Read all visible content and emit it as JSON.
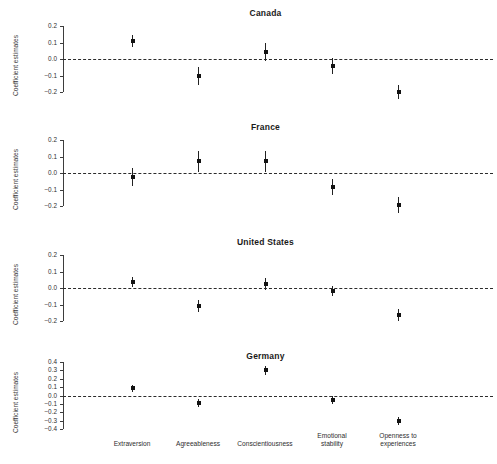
{
  "figure": {
    "ylabel": "Coefficient estimates",
    "categories": [
      "Extraversion",
      "Agreeableness",
      "Conscientiousness",
      "Emotional\nstability",
      "Openness to\nexperiences"
    ]
  },
  "chart_data": {
    "type": "scatter",
    "title": "",
    "xlabel": "",
    "ylabel": "Coefficient estimates",
    "grid": false,
    "legend": "none",
    "style": "coefficient plot with 95% confidence intervals, dashed zero reference line",
    "categories": [
      "Extraversion",
      "Agreeableness",
      "Conscientiousness",
      "Emotional stability",
      "Openness to experiences"
    ],
    "panels": [
      {
        "title": "Canada",
        "ylim": [
          -0.25,
          0.23
        ],
        "yticks": [
          0.2,
          0.1,
          0.0,
          -0.1,
          -0.2
        ],
        "yticklabels": [
          "0.2",
          "0.1",
          "0.0",
          "-0.1",
          "-0.2"
        ],
        "values": [
          0.11,
          -0.1,
          0.04,
          -0.045,
          -0.2
        ],
        "ci_low": [
          0.075,
          -0.155,
          -0.015,
          -0.09,
          -0.245
        ],
        "ci_high": [
          0.145,
          -0.05,
          0.095,
          0.005,
          -0.155
        ]
      },
      {
        "title": "France",
        "ylim": [
          -0.25,
          0.23
        ],
        "yticks": [
          0.2,
          0.1,
          0.0,
          -0.1,
          -0.2
        ],
        "yticklabels": [
          "0.2",
          "0.1",
          "0.0",
          "-0.1",
          "-0.2"
        ],
        "values": [
          -0.025,
          0.07,
          0.07,
          -0.085,
          -0.195
        ],
        "ci_low": [
          -0.08,
          0.005,
          0.005,
          -0.135,
          -0.245
        ],
        "ci_high": [
          0.03,
          0.135,
          0.135,
          -0.035,
          -0.145
        ]
      },
      {
        "title": "United States",
        "ylim": [
          -0.25,
          0.23
        ],
        "yticks": [
          0.2,
          0.1,
          0.0,
          -0.1,
          -0.2
        ],
        "yticklabels": [
          "0.2",
          "0.1",
          "0.0",
          "-0.1",
          "-0.2"
        ],
        "values": [
          0.035,
          -0.11,
          0.025,
          -0.02,
          -0.165
        ],
        "ci_low": [
          0.005,
          -0.145,
          -0.01,
          -0.05,
          -0.2
        ],
        "ci_high": [
          0.065,
          -0.075,
          0.06,
          0.01,
          -0.13
        ]
      },
      {
        "title": "Germany",
        "ylim": [
          -0.45,
          0.45
        ],
        "yticks": [
          0.4,
          0.3,
          0.2,
          0.1,
          0.0,
          -0.1,
          -0.2,
          -0.3,
          -0.4
        ],
        "yticklabels": [
          "0.4",
          "0.3",
          "0.2",
          "0.1",
          "0.0",
          "-0.1",
          "-0.2",
          "-0.3",
          "-0.4"
        ],
        "values": [
          0.085,
          -0.09,
          0.3,
          -0.055,
          -0.31
        ],
        "ci_low": [
          0.045,
          -0.14,
          0.245,
          -0.105,
          -0.355
        ],
        "ci_high": [
          0.125,
          -0.04,
          0.35,
          0.0,
          -0.26
        ]
      }
    ]
  }
}
